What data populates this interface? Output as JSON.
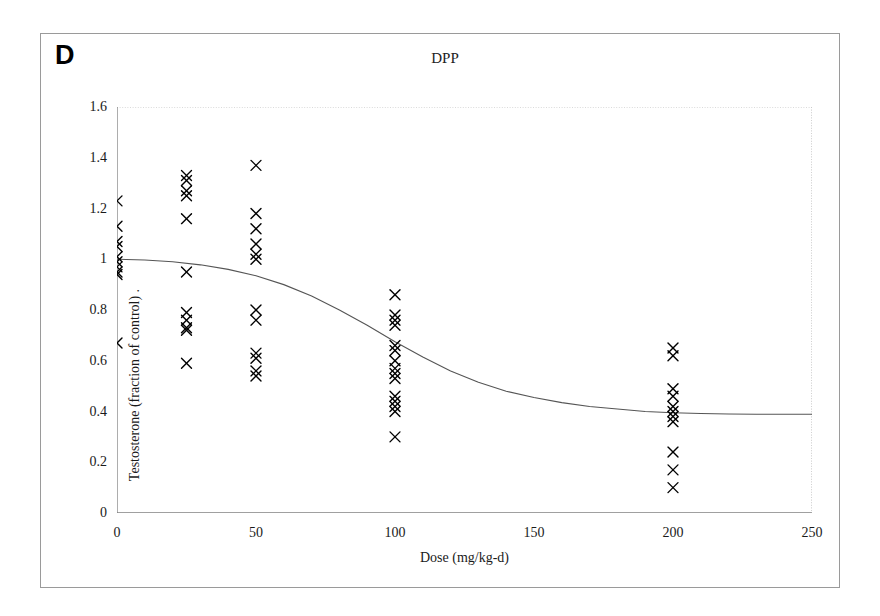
{
  "figure": {
    "panel_label": "D",
    "title": "DPP",
    "background_color": "#ffffff",
    "frame_color": "#9a9a9a",
    "marker_color": "#000000",
    "curve_color": "#555555",
    "axis_color": "#808080"
  },
  "chart_data": {
    "type": "scatter",
    "title": "DPP",
    "xlabel": "Dose (mg/kg-d)",
    "ylabel": "Testosterone (fraction of control) .",
    "xlim": [
      0,
      250
    ],
    "ylim": [
      0,
      1.6
    ],
    "xticks": [
      0,
      50,
      100,
      150,
      200,
      250
    ],
    "xtick_labels": [
      "0",
      "50",
      "100",
      "150",
      "200",
      "250"
    ],
    "yticks": [
      0,
      0.2,
      0.4,
      0.6,
      0.8,
      1,
      1.2,
      1.4,
      1.6
    ],
    "ytick_labels": [
      "0",
      "0.2",
      "0.4",
      "0.6",
      "0.8",
      "1",
      "1.2",
      "1.4",
      "1.6"
    ],
    "grid": false,
    "legend": null,
    "marker": "x",
    "series": [
      {
        "name": "Testosterone observations",
        "marker": "x",
        "points": [
          {
            "x": 0,
            "y": 1.23
          },
          {
            "x": 0,
            "y": 1.13
          },
          {
            "x": 0,
            "y": 1.07
          },
          {
            "x": 0,
            "y": 1.05
          },
          {
            "x": 0,
            "y": 1.01
          },
          {
            "x": 0,
            "y": 0.99
          },
          {
            "x": 0,
            "y": 0.97
          },
          {
            "x": 0,
            "y": 0.95
          },
          {
            "x": 0,
            "y": 0.94
          },
          {
            "x": 0,
            "y": 0.67
          },
          {
            "x": 25,
            "y": 1.33
          },
          {
            "x": 25,
            "y": 1.31
          },
          {
            "x": 25,
            "y": 1.27
          },
          {
            "x": 25,
            "y": 1.25
          },
          {
            "x": 25,
            "y": 1.16
          },
          {
            "x": 25,
            "y": 0.95
          },
          {
            "x": 25,
            "y": 0.79
          },
          {
            "x": 25,
            "y": 0.76
          },
          {
            "x": 25,
            "y": 0.73
          },
          {
            "x": 25,
            "y": 0.72
          },
          {
            "x": 25,
            "y": 0.59
          },
          {
            "x": 50,
            "y": 1.37
          },
          {
            "x": 50,
            "y": 1.18
          },
          {
            "x": 50,
            "y": 1.12
          },
          {
            "x": 50,
            "y": 1.06
          },
          {
            "x": 50,
            "y": 1.02
          },
          {
            "x": 50,
            "y": 1.0
          },
          {
            "x": 50,
            "y": 0.8
          },
          {
            "x": 50,
            "y": 0.76
          },
          {
            "x": 50,
            "y": 0.63
          },
          {
            "x": 50,
            "y": 0.61
          },
          {
            "x": 50,
            "y": 0.56
          },
          {
            "x": 50,
            "y": 0.54
          },
          {
            "x": 100,
            "y": 0.86
          },
          {
            "x": 100,
            "y": 0.78
          },
          {
            "x": 100,
            "y": 0.76
          },
          {
            "x": 100,
            "y": 0.74
          },
          {
            "x": 100,
            "y": 0.66
          },
          {
            "x": 100,
            "y": 0.64
          },
          {
            "x": 100,
            "y": 0.6
          },
          {
            "x": 100,
            "y": 0.57
          },
          {
            "x": 100,
            "y": 0.55
          },
          {
            "x": 100,
            "y": 0.53
          },
          {
            "x": 100,
            "y": 0.46
          },
          {
            "x": 100,
            "y": 0.44
          },
          {
            "x": 100,
            "y": 0.42
          },
          {
            "x": 100,
            "y": 0.4
          },
          {
            "x": 100,
            "y": 0.3
          },
          {
            "x": 200,
            "y": 0.65
          },
          {
            "x": 200,
            "y": 0.62
          },
          {
            "x": 200,
            "y": 0.49
          },
          {
            "x": 200,
            "y": 0.46
          },
          {
            "x": 200,
            "y": 0.42
          },
          {
            "x": 200,
            "y": 0.4
          },
          {
            "x": 200,
            "y": 0.38
          },
          {
            "x": 200,
            "y": 0.36
          },
          {
            "x": 200,
            "y": 0.24
          },
          {
            "x": 200,
            "y": 0.17
          },
          {
            "x": 200,
            "y": 0.1
          }
        ]
      }
    ],
    "fit_curve": {
      "name": "sigmoid fit",
      "x": [
        0,
        10,
        20,
        30,
        40,
        50,
        60,
        70,
        80,
        90,
        100,
        110,
        120,
        130,
        140,
        150,
        160,
        170,
        180,
        190,
        200,
        210,
        220,
        230,
        240,
        250
      ],
      "y": [
        1.0,
        0.997,
        0.99,
        0.978,
        0.96,
        0.935,
        0.9,
        0.855,
        0.8,
        0.74,
        0.675,
        0.615,
        0.56,
        0.515,
        0.48,
        0.455,
        0.435,
        0.42,
        0.41,
        0.4,
        0.395,
        0.392,
        0.39,
        0.389,
        0.389,
        0.389
      ]
    }
  }
}
